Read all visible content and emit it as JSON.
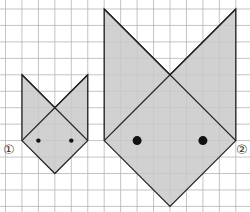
{
  "grid": {
    "origin_x": 5.5,
    "origin_y": 9,
    "cell": 16.45,
    "cols": 15,
    "rows": 13,
    "line_color": "#b5b5b5"
  },
  "colors": {
    "fill": "#c9c9c9",
    "stroke": "#222222",
    "eye": "#111111"
  },
  "figures": [
    {
      "id": "1",
      "label": "①",
      "ears_top": [
        [
          1,
          4
        ],
        [
          5,
          4
        ]
      ],
      "cross": [
        3,
        6
      ],
      "corners": [
        [
          1,
          8
        ],
        [
          5,
          8
        ]
      ],
      "bottom": [
        3,
        10
      ],
      "eyes": [
        [
          2,
          8
        ],
        [
          4,
          8
        ]
      ],
      "eye_radius": 2.2,
      "label_pos": [
        3,
        143
      ]
    },
    {
      "id": "2",
      "label": "②",
      "ears_top": [
        [
          6,
          0
        ],
        [
          14,
          0
        ]
      ],
      "cross": [
        10,
        4
      ],
      "corners": [
        [
          6,
          8
        ],
        [
          14,
          8
        ]
      ],
      "bottom": [
        10,
        12
      ],
      "eyes": [
        [
          8,
          8
        ],
        [
          12,
          8
        ]
      ],
      "eye_radius": 4.5,
      "label_pos": [
        236,
        143
      ]
    }
  ]
}
